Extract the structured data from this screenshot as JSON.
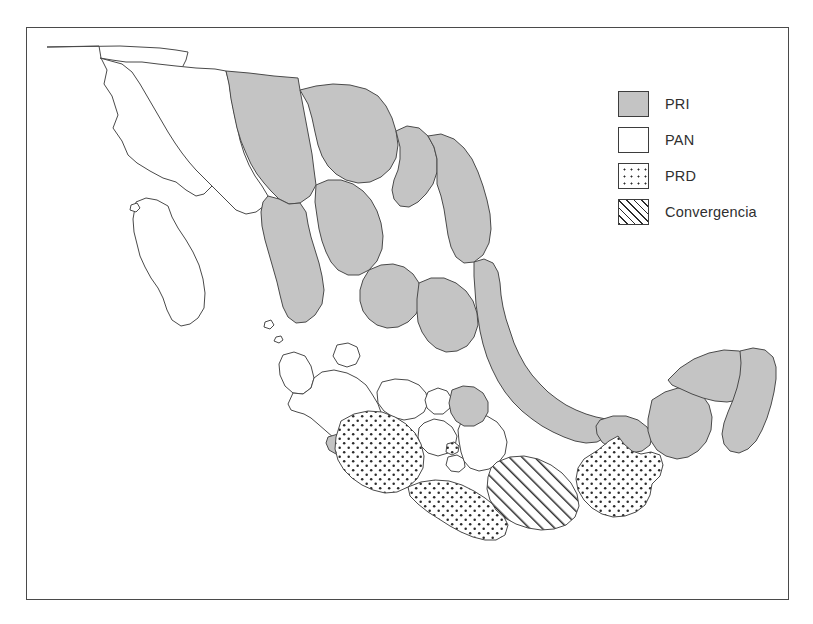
{
  "figure": {
    "type": "choropleth-map",
    "region": "Mexico",
    "background_color": "#ffffff",
    "frame_color": "#4a4a4a"
  },
  "legend": {
    "position": "top-right",
    "items": [
      {
        "label": "PRI",
        "pattern": "solid-gray",
        "color": "#c4c4c4"
      },
      {
        "label": "PAN",
        "pattern": "solid-white",
        "color": "#ffffff"
      },
      {
        "label": "PRD",
        "pattern": "dotted",
        "color": "#ffffff"
      },
      {
        "label": "Convergencia",
        "pattern": "diagonal-hatch",
        "color": "#ffffff"
      }
    ]
  },
  "map_data": {
    "type": "categorical-choropleth",
    "categories": [
      "PRI",
      "PAN",
      "PRD",
      "Convergencia"
    ],
    "regions": [
      {
        "name": "Baja California",
        "value": "PAN"
      },
      {
        "name": "Baja California Sur",
        "value": "PAN"
      },
      {
        "name": "Sonora",
        "value": "PAN"
      },
      {
        "name": "Chihuahua",
        "value": "PRI"
      },
      {
        "name": "Coahuila",
        "value": "PRI"
      },
      {
        "name": "Nuevo Leon",
        "value": "PRI"
      },
      {
        "name": "Tamaulipas",
        "value": "PRI"
      },
      {
        "name": "Sinaloa",
        "value": "PRI"
      },
      {
        "name": "Durango",
        "value": "PRI"
      },
      {
        "name": "Zacatecas",
        "value": "PRI"
      },
      {
        "name": "San Luis Potosi",
        "value": "PRI"
      },
      {
        "name": "Nayarit",
        "value": "PAN"
      },
      {
        "name": "Jalisco",
        "value": "PAN"
      },
      {
        "name": "Aguascalientes",
        "value": "PAN"
      },
      {
        "name": "Guanajuato",
        "value": "PAN"
      },
      {
        "name": "Queretaro",
        "value": "PAN"
      },
      {
        "name": "Hidalgo",
        "value": "PRI"
      },
      {
        "name": "Colima",
        "value": "PRI"
      },
      {
        "name": "Michoacan",
        "value": "PRD"
      },
      {
        "name": "Mexico",
        "value": "PAN"
      },
      {
        "name": "Distrito Federal",
        "value": "PRD"
      },
      {
        "name": "Morelos",
        "value": "PAN"
      },
      {
        "name": "Tlaxcala",
        "value": "PAN"
      },
      {
        "name": "Puebla",
        "value": "PAN"
      },
      {
        "name": "Veracruz",
        "value": "PRI"
      },
      {
        "name": "Guerrero",
        "value": "PRD"
      },
      {
        "name": "Oaxaca",
        "value": "Convergencia"
      },
      {
        "name": "Chiapas",
        "value": "PRD"
      },
      {
        "name": "Tabasco",
        "value": "PRI"
      },
      {
        "name": "Campeche",
        "value": "PRI"
      },
      {
        "name": "Yucatan",
        "value": "PRI"
      },
      {
        "name": "Quintana Roo",
        "value": "PRI"
      }
    ]
  }
}
